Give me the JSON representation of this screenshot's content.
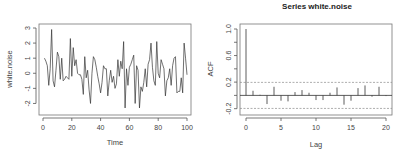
{
  "chart_data": [
    {
      "type": "line",
      "title": "",
      "xlabel": "Time",
      "ylabel": "white.noise",
      "xlim": [
        0,
        100
      ],
      "ylim": [
        -2.5,
        3
      ],
      "xticks": [
        0,
        20,
        40,
        60,
        80,
        100
      ],
      "xtick_labels": [
        "0",
        "20",
        "40",
        "60",
        "80",
        "100"
      ],
      "yticks": [
        -2,
        -1,
        0,
        1,
        2,
        3
      ],
      "ytick_labels": [
        "-2",
        "-1",
        "0",
        "1",
        "2",
        "3"
      ],
      "x": [
        1,
        2,
        3,
        4,
        5,
        6,
        7,
        8,
        9,
        10,
        11,
        12,
        13,
        14,
        15,
        16,
        17,
        18,
        19,
        20,
        21,
        22,
        23,
        24,
        25,
        26,
        27,
        28,
        29,
        30,
        31,
        32,
        33,
        34,
        35,
        36,
        37,
        38,
        39,
        40,
        41,
        42,
        43,
        44,
        45,
        46,
        47,
        48,
        49,
        50,
        51,
        52,
        53,
        54,
        55,
        56,
        57,
        58,
        59,
        60,
        61,
        62,
        63,
        64,
        65,
        66,
        67,
        68,
        69,
        70,
        71,
        72,
        73,
        74,
        75,
        76,
        77,
        78,
        79,
        80,
        81,
        82,
        83,
        84,
        85,
        86,
        87,
        88,
        89,
        90,
        91,
        92,
        93,
        94,
        95,
        96,
        97,
        98,
        99,
        100
      ],
      "values": [
        1.0,
        0.8,
        0.5,
        -0.8,
        0.3,
        2.9,
        -0.5,
        -0.9,
        0.2,
        1.4,
        1.1,
        -0.4,
        1.0,
        -0.5,
        -0.4,
        -0.2,
        -0.3,
        -0.4,
        2.3,
        -0.2,
        1.7,
        0.5,
        0.9,
        0.0,
        -0.1,
        -0.1,
        -0.4,
        -1.4,
        1.1,
        -0.3,
        0.2,
        -1.1,
        -2.0,
        0.0,
        1.1,
        0.9,
        0.4,
        -0.2,
        -0.7,
        -1.3,
        -0.6,
        0.5,
        0.3,
        0.3,
        -1.5,
        -0.5,
        0.2,
        -0.6,
        -0.2,
        -1.0,
        -0.7,
        0.9,
        -0.2,
        0.8,
        0.3,
        2.1,
        -2.3,
        0.3,
        -0.8,
        0.4,
        0.6,
        0.9,
        1.2,
        -2.0,
        0.5,
        0.2,
        -2.3,
        -0.9,
        -1.2,
        -0.6,
        0.3,
        -0.9,
        0.6,
        0.9,
        2.0,
        0.4,
        -0.5,
        -0.8,
        2.1,
        0.0,
        -0.3,
        0.9,
        0.6,
        0.3,
        -1.5,
        -0.5,
        -0.3,
        0.3,
        -0.8,
        0.5,
        1.0,
        1.1,
        -1.3,
        -1.2,
        -1.2,
        -0.3,
        -1.3,
        2.0,
        1.0,
        -0.1
      ]
    },
    {
      "type": "bar",
      "title": "Series  white.noise",
      "xlabel": "Lag",
      "ylabel": "ACF",
      "xlim": [
        0,
        20
      ],
      "ylim": [
        -0.25,
        1.0
      ],
      "xticks": [
        0,
        5,
        10,
        15,
        20
      ],
      "xtick_labels": [
        "0",
        "5",
        "10",
        "15",
        "20"
      ],
      "yticks": [
        -0.2,
        0.0,
        0.2,
        0.4,
        0.6,
        0.8,
        1.0
      ],
      "ytick_labels": [
        "-0.2",
        "",
        "0.2",
        "",
        "0.6",
        "",
        "1.0"
      ],
      "lags": [
        0,
        1,
        2,
        3,
        4,
        5,
        6,
        7,
        8,
        9,
        10,
        11,
        12,
        13,
        14,
        15,
        16,
        17,
        18,
        19,
        20
      ],
      "values": [
        1.0,
        0.07,
        0.01,
        -0.13,
        0.13,
        -0.08,
        -0.09,
        0.05,
        0.08,
        0.04,
        -0.07,
        -0.07,
        0.04,
        0.12,
        -0.14,
        -0.08,
        0.11,
        0.15,
        -0.02,
        0.13,
        -0.01
      ],
      "confidence_bound": 0.196
    }
  ]
}
